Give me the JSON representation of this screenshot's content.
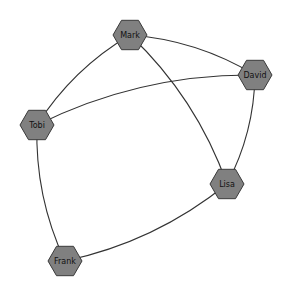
{
  "graph": {
    "nodes": [
      {
        "id": "Mark",
        "label": "Mark",
        "x": 130,
        "y": 35
      },
      {
        "id": "David",
        "label": "David",
        "x": 255,
        "y": 75
      },
      {
        "id": "Tobi",
        "label": "Tobi",
        "x": 37,
        "y": 125
      },
      {
        "id": "Lisa",
        "label": "Lisa",
        "x": 227,
        "y": 184
      },
      {
        "id": "Frank",
        "label": "Frank",
        "x": 65,
        "y": 261
      }
    ],
    "edges": [
      {
        "source": "Mark",
        "target": "Tobi"
      },
      {
        "source": "Mark",
        "target": "David"
      },
      {
        "source": "Mark",
        "target": "Lisa"
      },
      {
        "source": "Tobi",
        "target": "David"
      },
      {
        "source": "Tobi",
        "target": "Frank"
      },
      {
        "source": "David",
        "target": "Lisa"
      },
      {
        "source": "Lisa",
        "target": "Frank"
      }
    ],
    "colors": {
      "node_fill": "#808080",
      "node_stroke": "#3a3a3a",
      "edge": "#333333"
    }
  }
}
